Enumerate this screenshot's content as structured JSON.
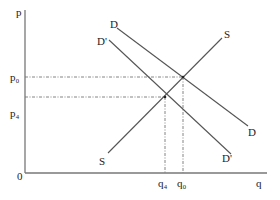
{
  "diagram": {
    "type": "supply-demand",
    "axes": {
      "y_label": "p",
      "x_label": "q",
      "origin_label": "0"
    },
    "price_labels": {
      "p0": "p₀",
      "p4": "p₄"
    },
    "quantity_labels": {
      "q4": "q₄",
      "q0": "q₀"
    },
    "curves": [
      {
        "id": "D",
        "label_start": "D",
        "label_end": "D"
      },
      {
        "id": "D_prime",
        "label_start": "D'",
        "label_end": "D'"
      },
      {
        "id": "S",
        "label_start": "S",
        "label_end": "S"
      }
    ],
    "equilibria": [
      {
        "name": "original",
        "price": "p₀",
        "quantity": "q₀",
        "curves": [
          "D",
          "S"
        ]
      },
      {
        "name": "shifted",
        "price": "p₄",
        "quantity": "q₄",
        "curves": [
          "D'",
          "S"
        ]
      }
    ],
    "colors": {
      "lines": "#555555",
      "axes": "#777777",
      "text": "#222222",
      "background": "#ffffff"
    }
  }
}
